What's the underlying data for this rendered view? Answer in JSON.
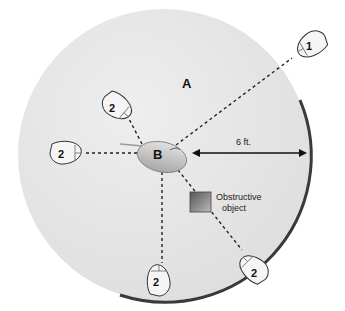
{
  "diagram": {
    "zone_label": "A",
    "receiver_label": "B",
    "distance_label": "6 ft.",
    "obstacle_label_line1": "Obstructive",
    "obstacle_label_line2": "object",
    "mice": [
      {
        "label": "1",
        "position": "upper-right, outside range"
      },
      {
        "label": "2",
        "position": "upper-left"
      },
      {
        "label": "2",
        "position": "left"
      },
      {
        "label": "2",
        "position": "bottom"
      },
      {
        "label": "2",
        "position": "bottom-right"
      }
    ],
    "colors": {
      "range_fill": "#e4e4e4",
      "range_edge": "#3a3a3a",
      "device_fill": "#f4f4f4",
      "line": "#222222"
    }
  }
}
